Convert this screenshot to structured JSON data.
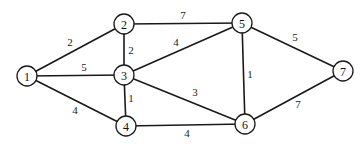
{
  "graph": {
    "type": "weighted-undirected",
    "nodes": [
      {
        "id": "1",
        "label": "1",
        "x": 27,
        "y": 76
      },
      {
        "id": "2",
        "label": "2",
        "x": 124,
        "y": 24
      },
      {
        "id": "3",
        "label": "3",
        "x": 124,
        "y": 75
      },
      {
        "id": "4",
        "label": "4",
        "x": 126,
        "y": 126
      },
      {
        "id": "5",
        "label": "5",
        "x": 242,
        "y": 23
      },
      {
        "id": "6",
        "label": "6",
        "x": 245,
        "y": 124
      },
      {
        "id": "7",
        "label": "7",
        "x": 343,
        "y": 71
      }
    ],
    "edges": [
      {
        "from": "1",
        "to": "2",
        "weight": "2",
        "lx": 70,
        "ly": 42
      },
      {
        "from": "1",
        "to": "3",
        "weight": "5",
        "lx": 84,
        "ly": 67
      },
      {
        "from": "1",
        "to": "4",
        "weight": "4",
        "lx": 75,
        "ly": 110
      },
      {
        "from": "2",
        "to": "3",
        "weight": "2",
        "lx": 131,
        "ly": 50
      },
      {
        "from": "2",
        "to": "5",
        "weight": "7",
        "lx": 183,
        "ly": 15
      },
      {
        "from": "3",
        "to": "5",
        "weight": "4",
        "lx": 176,
        "ly": 42
      },
      {
        "from": "3",
        "to": "4",
        "weight": "1",
        "lx": 131,
        "ly": 98
      },
      {
        "from": "3",
        "to": "6",
        "weight": "3",
        "lx": 195,
        "ly": 92
      },
      {
        "from": "4",
        "to": "6",
        "weight": "4",
        "lx": 187,
        "ly": 133
      },
      {
        "from": "5",
        "to": "6",
        "weight": "1",
        "lx": 250,
        "ly": 74
      },
      {
        "from": "5",
        "to": "7",
        "weight": "5",
        "lx": 295,
        "ly": 37
      },
      {
        "from": "6",
        "to": "7",
        "weight": "7",
        "lx": 298,
        "ly": 104
      }
    ]
  }
}
